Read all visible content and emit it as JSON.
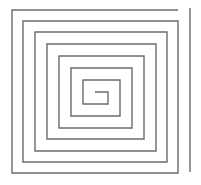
{
  "figure": {
    "type": "line-drawing",
    "background_color": "#ffffff",
    "canvas": {
      "width": 201,
      "height": 185
    }
  },
  "chart_data": {
    "type": "line",
    "subtitle": "",
    "xlabel": "",
    "ylabel": "",
    "grid": false,
    "legend_position": "none",
    "xlim": [
      0,
      201
    ],
    "ylim": [
      0,
      185
    ],
    "axis_visible": false,
    "tick_labels": [],
    "annotations": [],
    "series": [
      {
        "name": "spiral-outer-terminus",
        "stroke_color": "#6b6b6b",
        "stroke_width": 1.4,
        "closed": false,
        "points": [
          [
            190,
            8
          ],
          [
            190,
            172
          ]
        ]
      },
      {
        "name": "square-spiral",
        "stroke_color": "#6b6b6b",
        "stroke_width": 1.4,
        "closed": false,
        "turns": 6,
        "points": [
          [
            178,
            10
          ],
          [
            12,
            10
          ],
          [
            12,
            173
          ],
          [
            178,
            173
          ],
          [
            178,
            21
          ],
          [
            23,
            21
          ],
          [
            23,
            162
          ],
          [
            167,
            162
          ],
          [
            167,
            32
          ],
          [
            35,
            32
          ],
          [
            35,
            151
          ],
          [
            156,
            151
          ],
          [
            156,
            44
          ],
          [
            47,
            44
          ],
          [
            47,
            139
          ],
          [
            144,
            139
          ],
          [
            144,
            56
          ],
          [
            59,
            56
          ],
          [
            59,
            128
          ],
          [
            132,
            128
          ],
          [
            132,
            68
          ],
          [
            71,
            68
          ],
          [
            71,
            116
          ],
          [
            120,
            116
          ],
          [
            120,
            80
          ],
          [
            83,
            80
          ],
          [
            83,
            104
          ],
          [
            108,
            104
          ],
          [
            108,
            92
          ],
          [
            95,
            92
          ]
        ]
      }
    ]
  }
}
